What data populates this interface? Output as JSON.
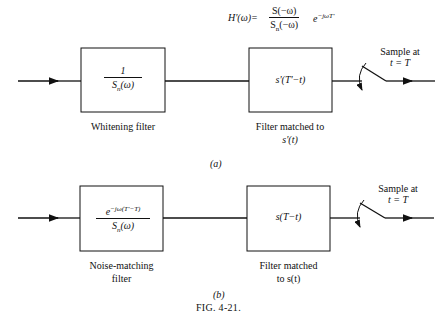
{
  "formula": {
    "lhs": "H'(ω)=",
    "num": "S(−ω)",
    "den_s": "S",
    "den_sub": "n",
    "den_arg": "(−ω)",
    "exp_base": "e",
    "exp": "−jωT'"
  },
  "diagram_a": {
    "box1": {
      "num": "1",
      "den_s": "S",
      "den_sub": "n",
      "den_arg": "(ω)",
      "label": "Whitening filter"
    },
    "box2": {
      "content": "s'(T'−t)",
      "label_line1": "Filter matched to",
      "label_line2": "s'(t)"
    },
    "sampler": {
      "line1": "Sample at",
      "line2": "t = T"
    },
    "caption": "(a)"
  },
  "diagram_b": {
    "box1": {
      "exp_base": "e",
      "exp": "−jω(T'−T)",
      "den_s": "S",
      "den_sub": "n",
      "den_arg": "(ω)",
      "label_line1": "Noise-matching",
      "label_line2": "filter"
    },
    "box2": {
      "content": "s(T−t)",
      "label_line1": "Filter matched",
      "label_line2": "to s(t)"
    },
    "sampler": {
      "line1": "Sample at",
      "line2": "t = T"
    },
    "caption": "(b)"
  },
  "figure_caption": "FIG. 4-21."
}
